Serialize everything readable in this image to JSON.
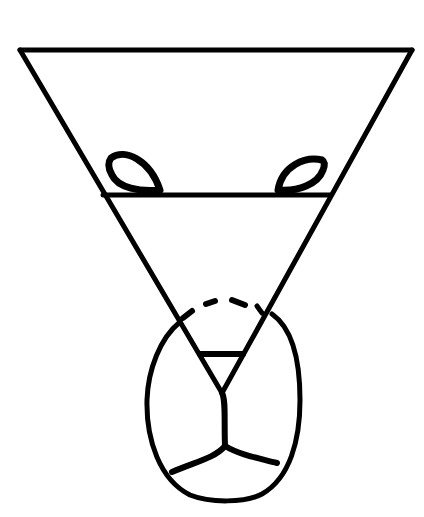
{
  "diagram": {
    "background": "#ffffff",
    "ink_color": "#000000",
    "stroke_width": 5,
    "elements": [
      {
        "name": "top-edge",
        "type": "line",
        "from": [
          20,
          50
        ],
        "to": [
          412,
          50
        ]
      },
      {
        "name": "left-edge",
        "type": "line",
        "from": [
          20,
          50
        ],
        "to": [
          222,
          393
        ]
      },
      {
        "name": "right-edge",
        "type": "line",
        "from": [
          412,
          50
        ],
        "to": [
          222,
          393
        ]
      },
      {
        "name": "crossbar",
        "type": "line",
        "from": [
          103,
          195
        ],
        "to": [
          330,
          195
        ]
      },
      {
        "name": "left-oval",
        "type": "leaf",
        "bbox": [
          108,
          152,
          163,
          193
        ]
      },
      {
        "name": "right-oval",
        "type": "leaf",
        "bbox": [
          275,
          157,
          325,
          193
        ]
      },
      {
        "name": "inner-bar",
        "type": "line",
        "from": [
          200,
          354
        ],
        "to": [
          243,
          354
        ]
      },
      {
        "name": "dashed-arc",
        "type": "dashed",
        "points": [
          [
            183,
            318
          ],
          [
            215,
            300
          ],
          [
            246,
            302
          ],
          [
            262,
            313
          ]
        ]
      },
      {
        "name": "egg-outline",
        "type": "closed-curve",
        "bbox": [
          147,
          305,
          300,
          500
        ]
      },
      {
        "name": "stem",
        "type": "line",
        "from": [
          222,
          393
        ],
        "to": [
          225,
          446
        ]
      },
      {
        "name": "left-branch",
        "type": "line",
        "from": [
          225,
          446
        ],
        "to": [
          172,
          472
        ]
      },
      {
        "name": "right-branch",
        "type": "line",
        "from": [
          225,
          446
        ],
        "to": [
          277,
          463
        ]
      }
    ]
  }
}
